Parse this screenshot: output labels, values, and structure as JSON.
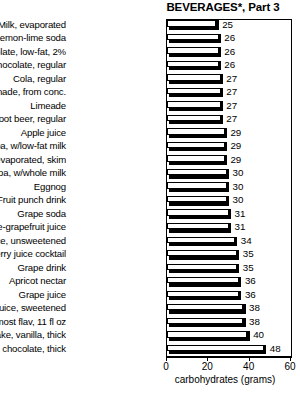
{
  "chart_data": {
    "type": "bar",
    "orientation": "horizontal",
    "title": "BEVERAGES*, Part 3",
    "xlabel": "carbohydrates (grams)",
    "ylabel": "",
    "xlim": [
      0,
      60
    ],
    "grid": false,
    "legend": null,
    "xticks": [
      0,
      20,
      40,
      60
    ],
    "xtick_labels": [
      "0",
      "20",
      "40",
      "60"
    ],
    "categories": [
      "Milk, evaporated",
      "Lemon-lime soda",
      "Milk, chocolate, low-fat, 2%",
      "Milk, chocolate, regular",
      "Cola, regular",
      "Lemonade, from conc.",
      "Limeade",
      "Root beer, regular",
      "Apple juice",
      "Cocoa, w/low-fat milk",
      "Milk, evaporated, skim",
      "Cocoa, w/whole milk",
      "Eggnog",
      "Fruit punch drink",
      "Grape soda",
      "Pineapple-grapefruit juice",
      "Pineapple juice, unsweetened",
      "Cranberry juice cocktail",
      "Grape drink",
      "Apricot nectar",
      "Grape juice",
      "Cranberry juice, sweetened",
      "Slim Fast, most flav, 11 fl oz",
      "Shake, vanilla, thick",
      "Shake, chocolate, thick"
    ],
    "values": [
      25,
      26,
      26,
      26,
      27,
      27,
      27,
      27,
      29,
      29,
      29,
      30,
      30,
      30,
      31,
      31,
      34,
      35,
      35,
      36,
      36,
      38,
      38,
      40,
      48
    ],
    "value_labels": [
      "25",
      "26",
      "26",
      "26",
      "27",
      "27",
      "27",
      "27",
      "29",
      "29",
      "29",
      "30",
      "30",
      "30",
      "31",
      "31",
      "34",
      "35",
      "35",
      "36",
      "36",
      "38",
      "38",
      "40",
      "48"
    ]
  },
  "colors": {
    "bar_fill": "#ffffff",
    "bar_outline": "#000000",
    "bar_shadow": "#000000",
    "text": "#000000",
    "background": "#ffffff"
  }
}
